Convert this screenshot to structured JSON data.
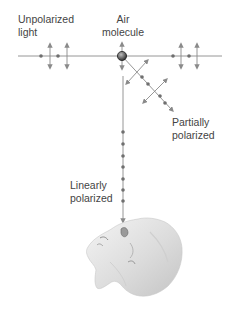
{
  "labels": {
    "unpolarized_line1": "Unpolarized",
    "unpolarized_line2": "light",
    "molecule_line1": "Air",
    "molecule_line2": "molecule",
    "partial_line1": "Partially",
    "partial_line2": "polarized",
    "linear_line1": "Linearly",
    "linear_line2": "polarized"
  },
  "colors": {
    "line": "#8a8a8a",
    "dot": "#6f6f6f",
    "molecule": "#555555",
    "text": "#444444"
  }
}
